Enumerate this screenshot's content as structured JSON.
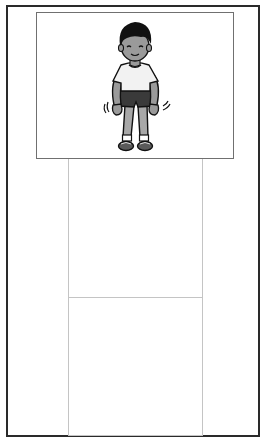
{
  "page": {
    "colors": {
      "outer_border": "#2a2a2a",
      "picture_border": "#707070",
      "box_border": "#c4c4c4",
      "background": "#ffffff"
    }
  },
  "illustration": {
    "subject": "boy-shaking-legs",
    "colors": {
      "hair": "#111111",
      "skin": "#9a9a9a",
      "shirt": "#f2f2f2",
      "shorts": "#3a3a3a",
      "socks": "#ffffff",
      "shoes": "#555555",
      "outline": "#111111"
    }
  },
  "answer_boxes": [
    {
      "id": "box-1",
      "content": ""
    },
    {
      "id": "box-2",
      "content": ""
    }
  ]
}
